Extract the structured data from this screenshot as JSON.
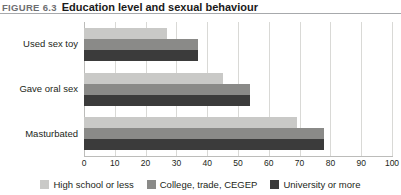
{
  "header": {
    "figure_label": "FIGURE 6.3",
    "title": "Education level and sexual behaviour"
  },
  "chart_data": {
    "type": "bar",
    "orientation": "horizontal",
    "title": "Education level and sexual behaviour",
    "xlabel": "",
    "ylabel": "",
    "xlim": [
      0,
      100
    ],
    "xticks": [
      "0",
      "10",
      "20",
      "30",
      "40",
      "50",
      "60",
      "70",
      "80",
      "90",
      "100"
    ],
    "grid": true,
    "legend_position": "bottom",
    "categories": [
      "Used sex toy",
      "Gave oral sex",
      "Masturbated"
    ],
    "series": [
      {
        "name": "High school or less",
        "color": "#c9c9c7",
        "values": [
          27,
          45,
          69
        ]
      },
      {
        "name": "College, trade, CEGEP",
        "color": "#8a8a88",
        "values": [
          37,
          54,
          78
        ]
      },
      {
        "name": "University or more",
        "color": "#3b3b3b",
        "values": [
          37,
          54,
          78
        ]
      }
    ]
  },
  "legend": {
    "items": [
      {
        "label": "High school or less",
        "color": "#c9c9c7"
      },
      {
        "label": "College, trade, CEGEP",
        "color": "#8a8a88"
      },
      {
        "label": "University or more",
        "color": "#3b3b3b"
      }
    ]
  }
}
